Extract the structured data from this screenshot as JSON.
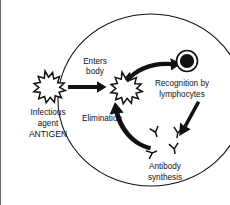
{
  "figure": {
    "background_color": "#ffffff",
    "ink_color": "#111111",
    "border_color": "#6b6b6b",
    "width": 230,
    "height": 205
  },
  "labels": {
    "infectious_agent_line1": "Infectious",
    "infectious_agent_line2": "agent",
    "infectious_agent_line3": "ANTIGEN",
    "enters_body_line1": "Enters",
    "enters_body_line2": "body",
    "recognition_line1": "Recognition by",
    "recognition_line2": "lymphocytes",
    "antibody_line1": "Antibody",
    "antibody_line2": "synthesis",
    "elimination": "Elimination"
  },
  "shapes": {
    "body_boundary": "large-ellipse",
    "antigen_outside": "spiked-burst",
    "antigen_inside": "spiked-burst",
    "lymphocyte": "circle-with-dark-nucleus",
    "antibodies": "y-shaped-immunoglobulins",
    "antibody_count": 4
  },
  "arrows": {
    "entry": "straight-right-arrow",
    "recognition": "curved-arrow-right",
    "secretion": "diagonal-arrow-down-left",
    "elimination": "curved-arrow-up-left"
  }
}
